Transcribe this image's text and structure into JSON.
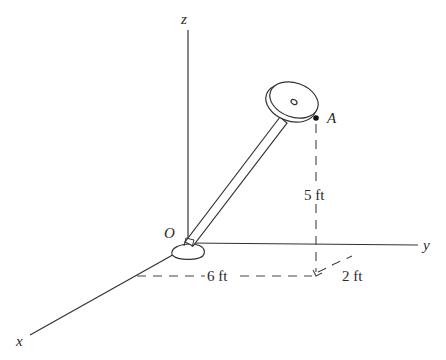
{
  "figure": {
    "type": "3D position vector diagram",
    "axes": {
      "x_label": "x",
      "y_label": "y",
      "z_label": "z"
    },
    "origin_label": "O",
    "point_label": "A",
    "dimensions": {
      "height": "5 ft",
      "y_distance": "6 ft",
      "x_distance": "2 ft"
    },
    "colors": {
      "line": "#333333",
      "background": "#ffffff"
    }
  }
}
